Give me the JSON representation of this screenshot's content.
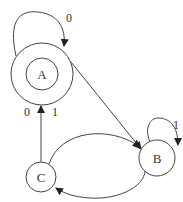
{
  "diagram": {
    "type": "finite-state-automaton",
    "states": [
      {
        "id": "A",
        "label": "A",
        "accepting": true
      },
      {
        "id": "B",
        "label": "B",
        "accepting": false
      },
      {
        "id": "C",
        "label": "C",
        "accepting": false
      }
    ],
    "transitions": [
      {
        "from": "A",
        "to": "A",
        "label": "0"
      },
      {
        "from": "A",
        "to": "B",
        "label": ""
      },
      {
        "from": "B",
        "to": "B",
        "label": "1"
      },
      {
        "from": "B",
        "to": "C",
        "label": "0"
      },
      {
        "from": "C",
        "to": "B",
        "label": ""
      },
      {
        "from": "C",
        "to": "A",
        "label_left": "0",
        "label_right": "1"
      }
    ],
    "labels": {
      "a_self": "0",
      "b_self": "1",
      "b_to_c": "0",
      "c_to_a_left": "0",
      "c_to_a_right": "1"
    }
  }
}
